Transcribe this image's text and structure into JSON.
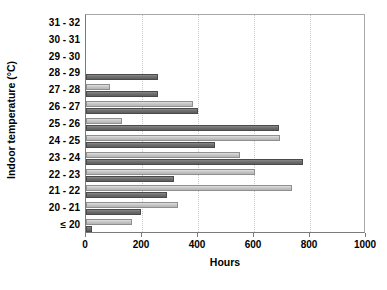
{
  "chart_data": {
    "type": "bar",
    "orientation": "horizontal",
    "grouped": true,
    "title": "",
    "xlabel": "Hours",
    "ylabel": "Indoor temperature (°C)",
    "xlim": [
      0,
      1000
    ],
    "xticks": [
      0,
      200,
      400,
      600,
      800,
      1000
    ],
    "xtick_labels": [
      "0",
      "200",
      "400",
      "600",
      "800",
      "1000"
    ],
    "grid": "vertical-dotted",
    "legend": "none",
    "categories": [
      "31 - 32",
      "30 - 31",
      "29 - 30",
      "28 - 29",
      "27 - 28",
      "26 - 27",
      "25 - 26",
      "24 - 25",
      "23 - 24",
      "22 - 23",
      "21 - 22",
      "20 - 21",
      "≤ 20"
    ],
    "series": [
      {
        "name": "series-a",
        "color": "#c6c6c6",
        "values": [
          0,
          0,
          0,
          0,
          85,
          383,
          130,
          693,
          550,
          604,
          736,
          330,
          165
        ]
      },
      {
        "name": "series-b",
        "color": "#6e6e6e",
        "values": [
          0,
          0,
          0,
          256,
          258,
          400,
          690,
          460,
          775,
          313,
          290,
          196,
          22
        ]
      }
    ]
  },
  "axis_labels": {
    "y_title": "Indoor temperature (°C)",
    "x_title": "Hours"
  },
  "colors": {
    "series_a": "#c6c6c6",
    "series_b": "#6e6e6e",
    "gridline": "#c9c9c9",
    "axis": "#7a7a7a",
    "plot_border": "#a8a8a8",
    "background": "#ffffff",
    "text": "#000000"
  }
}
